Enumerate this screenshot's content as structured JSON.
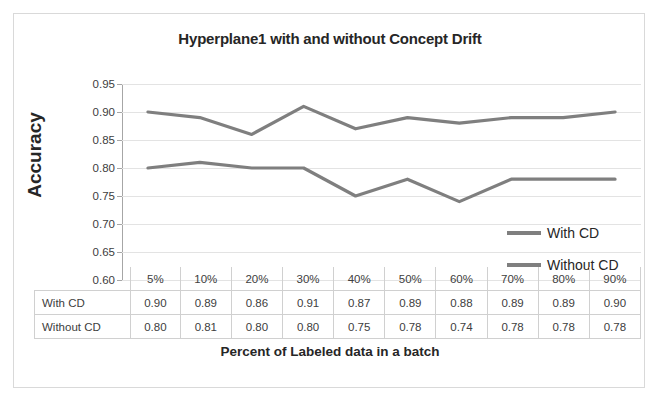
{
  "chart_data": {
    "type": "line",
    "title": "Hyperplane1 with and without Concept Drift",
    "xlabel": "Percent of Labeled data in a batch",
    "ylabel": "Accuracy",
    "categories": [
      "5%",
      "10%",
      "20%",
      "30%",
      "40%",
      "50%",
      "60%",
      "70%",
      "80%",
      "90%"
    ],
    "series": [
      {
        "name": "With CD",
        "values": [
          0.9,
          0.89,
          0.86,
          0.91,
          0.87,
          0.89,
          0.88,
          0.89,
          0.89,
          0.9
        ],
        "color": "#7f7f7f"
      },
      {
        "name": "Without CD",
        "values": [
          0.8,
          0.81,
          0.8,
          0.8,
          0.75,
          0.78,
          0.74,
          0.78,
          0.78,
          0.78
        ],
        "color": "#7f7f7f"
      }
    ],
    "ylim": [
      0.6,
      0.95
    ],
    "ytick_step": 0.05,
    "yticks": [
      "0.95",
      "0.90",
      "0.85",
      "0.80",
      "0.75",
      "0.70",
      "0.65",
      "0.60"
    ],
    "grid": true,
    "legend_position": "inside-right",
    "data_table_shown": true
  },
  "table": {
    "row_labels": [
      "With CD",
      "Without CD"
    ]
  }
}
